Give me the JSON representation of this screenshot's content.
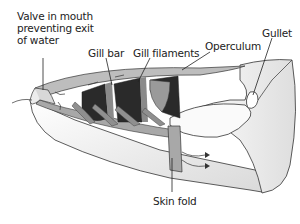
{
  "diagram": {
    "labels": {
      "valve": "Valve in mouth\npreventing exit\nof water",
      "gill_bar": "Gill bar",
      "gill_filaments": "Gill filaments",
      "operculum": "Operculum",
      "gullet": "Gullet",
      "skin_fold": "Skin fold"
    },
    "colors": {
      "outline": "#333333",
      "body_fill": "#f2f2f2",
      "mid_gray": "#b0b0b0",
      "dark_gill": "#2a2a2a",
      "filament_gray": "#8a8a8a"
    }
  }
}
